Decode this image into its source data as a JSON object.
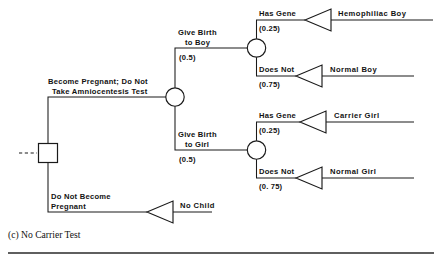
{
  "figure": {
    "caption": "(c) No Carrier Test",
    "decision_node_label": "decision-node",
    "root_incoming_label": "dashed-continuation"
  },
  "diagram_data": {
    "type": "decision-tree",
    "root": {
      "kind": "decision",
      "branches": [
        {
          "label": "Become Pregnant; Do Not Take Amniocentesis Test",
          "label_line_1": "Become Pregnant; Do Not",
          "label_line_2": "Take Amniocentesis Test",
          "probability": null
        },
        {
          "label": "Do Not Become Pregnant",
          "label_line_1": "Do Not Become",
          "label_line_2": "Pregnant",
          "probability": null,
          "terminal": "No Child"
        }
      ]
    },
    "chance_nodes": [
      {
        "id": "sex",
        "branches": [
          {
            "label_line_1": "Give Birth",
            "label_line_2": "to Boy",
            "probability": "(0.5)"
          },
          {
            "label_line_1": "Give  Birth",
            "label_line_2": "to Girl",
            "probability": "(0.5)"
          }
        ]
      },
      {
        "id": "boy-gene",
        "branches": [
          {
            "label": "Has Gene",
            "probability": "(0.25)",
            "terminal": "Hemophiliac Boy"
          },
          {
            "label": "Does Not",
            "probability": "(0.75)",
            "terminal": "Normal Boy"
          }
        ]
      },
      {
        "id": "girl-gene",
        "branches": [
          {
            "label": "Has Gene",
            "probability": "(0.25)",
            "terminal": "Carrier Girl"
          },
          {
            "label": "Does Not",
            "probability": "(0. 75)",
            "terminal": "Normal Girl"
          }
        ]
      }
    ],
    "terminals": [
      "Hemophiliac Boy",
      "Normal Boy",
      "Carrier Girl",
      "Normal Girl",
      "No Child"
    ]
  },
  "labels": {
    "pregnant_line1": "Become Pregnant; Do Not",
    "pregnant_line2": "Take Amniocentesis Test",
    "birth_boy_line1": "Give Birth",
    "birth_boy_line2": "to Boy",
    "birth_boy_prob": "(0.5)",
    "birth_girl_line1": "Give  Birth",
    "birth_girl_line2": "to Girl",
    "birth_girl_prob": "(0.5)",
    "boy_has_gene": "Has Gene",
    "boy_has_gene_prob": "(0.25)",
    "boy_does_not": "Does Not",
    "boy_does_not_prob": "(0.75)",
    "girl_has_gene": "Has Gene",
    "girl_has_gene_prob": "(0.25)",
    "girl_does_not": "Does Not",
    "girl_does_not_prob": "(0. 75)",
    "no_pregnant_line1": "Do Not Become",
    "no_pregnant_line2": "Pregnant",
    "outcome_hemophiliac_boy": "Hemophiliac Boy",
    "outcome_normal_boy": "Normal  Boy",
    "outcome_carrier_girl": "Carrier Girl",
    "outcome_normal_girl": "Normal  Girl",
    "outcome_no_child": "No  Child"
  },
  "colors": {
    "stroke": "#1a1a1a",
    "background": "#ffffff",
    "text": "#121212",
    "rule": "#2a2a2a"
  }
}
